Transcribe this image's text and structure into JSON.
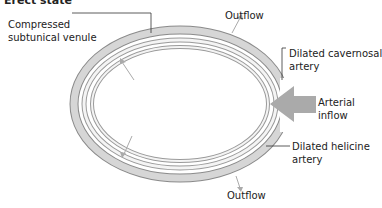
{
  "title": "Erect state",
  "labels": {
    "compressed_venule": [
      "Compressed",
      "subtunical venule"
    ],
    "outflow_top": "Outflow",
    "cavernosal_artery": [
      "Dilated cavernosal",
      "artery"
    ],
    "arterial_inflow": [
      "Arterial",
      "inflow"
    ],
    "helicine_artery": [
      "Dilated helicine",
      "artery"
    ],
    "outflow_bottom": "Outflow"
  },
  "colors": {
    "ring_fill": "#d6d6d6",
    "ring_stroke": "#8a8a8a",
    "arrow": "#aaaaaa",
    "leader": "#333333"
  }
}
